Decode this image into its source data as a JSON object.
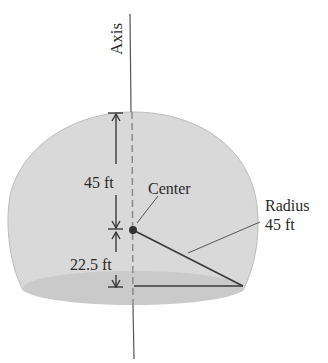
{
  "diagram": {
    "type": "truncated-sphere-dome",
    "colors": {
      "dome_fill": "#d9d9d9",
      "base_fill": "#c9c9c9",
      "line": "#3a3a3a",
      "axis": "#555555",
      "text": "#2a2a2a"
    },
    "labels": {
      "axis": "Axis",
      "top_dimension": "45 ft",
      "bottom_dimension": "22.5 ft",
      "center": "Center",
      "radius_title": "Radius",
      "radius_value": "45 ft"
    },
    "measurements": {
      "radius_ft": 45,
      "center_to_top_ft": 45,
      "center_to_base_ft": 22.5
    }
  }
}
